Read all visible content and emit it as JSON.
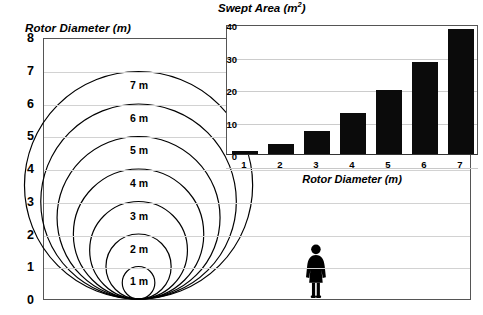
{
  "main_chart": {
    "title": "Rotor Diameter (m)",
    "y_ticks": [
      "0",
      "1",
      "2",
      "3",
      "4",
      "5",
      "6",
      "7",
      "8"
    ],
    "ylim": [
      0,
      8
    ],
    "circle_labels": [
      "1 m",
      "2 m",
      "3 m",
      "4 m",
      "5 m",
      "6 m",
      "7 m"
    ],
    "circle_diameters": [
      1,
      2,
      3,
      4,
      5,
      6,
      7
    ],
    "person_icon": "female-silhouette-icon",
    "person_height_m": 1.7
  },
  "inset_chart": {
    "title_prefix": "Swept Area (m",
    "title_sup": "2",
    "title_suffix": ")",
    "xlabel": "Rotor Diameter (m)",
    "y_ticks": [
      "0",
      "10",
      "20",
      "30",
      "40"
    ],
    "x_ticks": [
      "1",
      "2",
      "3",
      "4",
      "5",
      "6",
      "7"
    ]
  },
  "chart_data": {
    "type": "bar",
    "xlabel": "Rotor Diameter (m)",
    "ylabel": "Swept Area (m²)",
    "categories": [
      "1",
      "2",
      "3",
      "4",
      "5",
      "6",
      "7"
    ],
    "values": [
      0.79,
      3.14,
      7.07,
      12.57,
      19.63,
      28.27,
      38.48
    ],
    "ylim": [
      0,
      40
    ],
    "yticks": [
      0,
      10,
      20,
      30,
      40
    ],
    "grid": true,
    "legend": "none",
    "bar_color": "#0b0b0b",
    "secondary_chart": {
      "type": "scatter",
      "title": "Rotor Diameter (m)",
      "ylabel": "Rotor Diameter (m)",
      "ylim": [
        0,
        8
      ],
      "yticks": [
        0,
        1,
        2,
        3,
        4,
        5,
        6,
        7,
        8
      ],
      "series_name": "Rotor circles (tangent at ground)",
      "circle_diameters_m": [
        1,
        2,
        3,
        4,
        5,
        6,
        7
      ],
      "annotations": [
        "1 m",
        "2 m",
        "3 m",
        "4 m",
        "5 m",
        "6 m",
        "7 m"
      ],
      "reference_figure_height_m": 1.7
    }
  },
  "colors": {
    "bar": "#0b0b0b",
    "frame": "#555555",
    "grid": "#d2d2d2",
    "text": "#000000",
    "background": "#ffffff"
  }
}
